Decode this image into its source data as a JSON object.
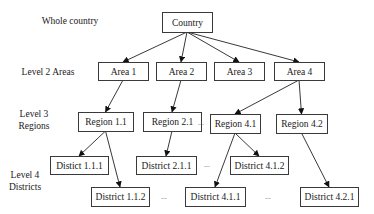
{
  "levels": [
    {
      "id": "level1",
      "lines": [
        "Whole country"
      ],
      "x": 70,
      "y": 24
    },
    {
      "id": "level2",
      "lines": [
        "Level 2 Areas"
      ],
      "x": 48,
      "y": 75
    },
    {
      "id": "level3",
      "lines": [
        "Level 3",
        "Regions"
      ],
      "x": 34,
      "y": 117
    },
    {
      "id": "level4",
      "lines": [
        "Level 4",
        "Districts"
      ],
      "x": 25,
      "y": 178
    }
  ],
  "nodes": {
    "country": {
      "label": "Country",
      "x": 162,
      "y": 12,
      "w": 50,
      "h": 20
    },
    "area1": {
      "label": "Area 1",
      "x": 98,
      "y": 62,
      "w": 50,
      "h": 18
    },
    "area2": {
      "label": "Area 2",
      "x": 156,
      "y": 62,
      "w": 50,
      "h": 18
    },
    "area3": {
      "label": "Area 3",
      "x": 214,
      "y": 62,
      "w": 50,
      "h": 18
    },
    "area4": {
      "label": "Area 4",
      "x": 274,
      "y": 62,
      "w": 50,
      "h": 18
    },
    "region11": {
      "label": "Region 1.1",
      "x": 78,
      "y": 112,
      "w": 55,
      "h": 19
    },
    "region21": {
      "label": "Region 2.1",
      "x": 143,
      "y": 112,
      "w": 58,
      "h": 19
    },
    "region41": {
      "label": "Region 4.1",
      "x": 210,
      "y": 114,
      "w": 50,
      "h": 19
    },
    "region42": {
      "label": "Region 4.2",
      "x": 276,
      "y": 114,
      "w": 51,
      "h": 19
    },
    "district111": {
      "label": "Distict 1.1.1",
      "x": 50,
      "y": 156,
      "w": 58,
      "h": 18
    },
    "district211": {
      "label": "District 2.1.1",
      "x": 136,
      "y": 156,
      "w": 60,
      "h": 18
    },
    "district412": {
      "label": "District 4.1.2",
      "x": 230,
      "y": 156,
      "w": 58,
      "h": 18
    },
    "district112": {
      "label": "District 1.1.2",
      "x": 91,
      "y": 187,
      "w": 58,
      "h": 19
    },
    "district411": {
      "label": "District 4.1.1",
      "x": 185,
      "y": 187,
      "w": 60,
      "h": 19
    },
    "district421": {
      "label": "District 4.2.1",
      "x": 300,
      "y": 187,
      "w": 58,
      "h": 19
    }
  },
  "edges": [
    [
      "country",
      "area1"
    ],
    [
      "country",
      "area2"
    ],
    [
      "country",
      "area3"
    ],
    [
      "country",
      "area4"
    ],
    [
      "area1",
      "region11"
    ],
    [
      "area2",
      "region21"
    ],
    [
      "area4",
      "region41"
    ],
    [
      "area4",
      "region42"
    ],
    [
      "region11",
      "district111"
    ],
    [
      "region11",
      "district112"
    ],
    [
      "region21",
      "district211"
    ],
    [
      "region41",
      "district411"
    ],
    [
      "region41",
      "district412"
    ],
    [
      "region42",
      "district421"
    ]
  ],
  "ellipses": [
    {
      "text": "...",
      "x": 201,
      "y": 125
    },
    {
      "text": "...",
      "x": 207,
      "y": 167
    },
    {
      "text": "...",
      "x": 164,
      "y": 199
    },
    {
      "text": "...",
      "x": 268,
      "y": 199
    }
  ]
}
